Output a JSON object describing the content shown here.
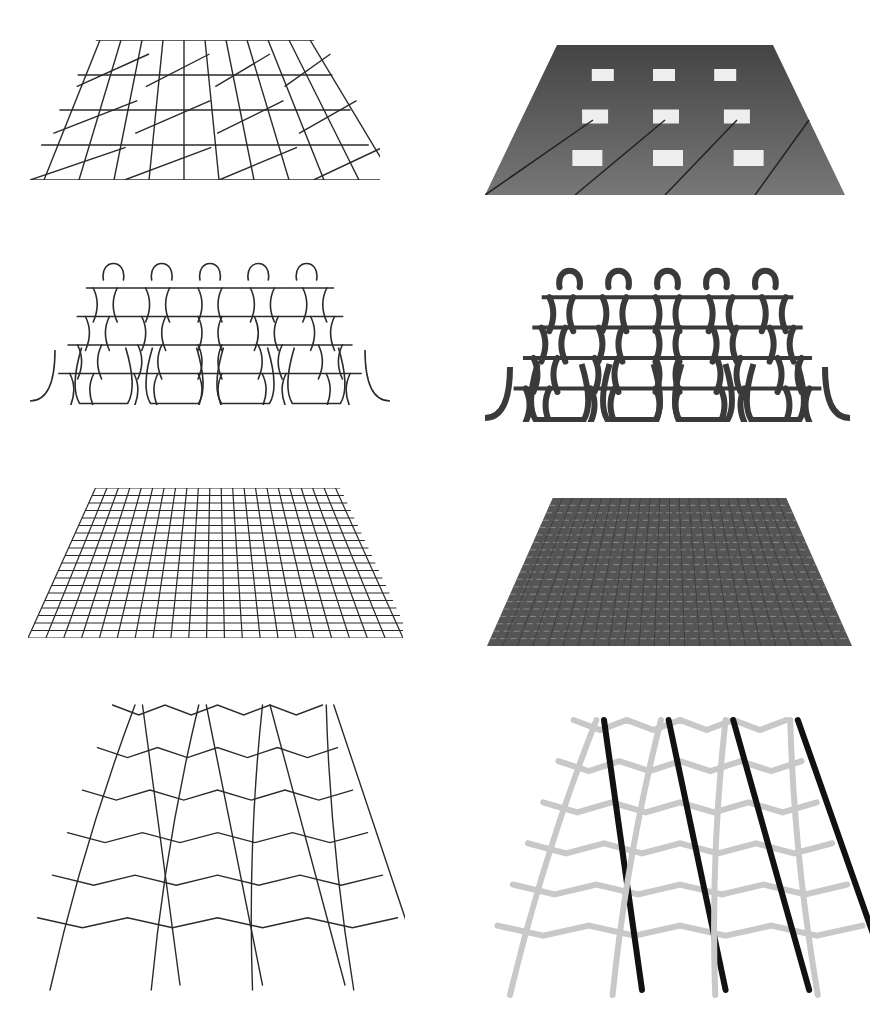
{
  "figure": {
    "layout": {
      "rows": 4,
      "cols": 2,
      "width": 890,
      "height": 1024
    },
    "colors": {
      "background": "#ffffff",
      "line": "#2a2a2a",
      "render_dark": "#4a4a4a",
      "render_mid": "#6e6e6e",
      "yarn_light": "#c8c8c8",
      "yarn_dark": "#111111"
    },
    "panels": [
      {
        "id": "woven-wire",
        "row": 0,
        "col": 0,
        "style": "wireframe",
        "pattern": "woven-diagonal",
        "box": [
          30,
          40,
          350,
          140
        ]
      },
      {
        "id": "woven-render",
        "row": 0,
        "col": 1,
        "style": "rendered",
        "pattern": "woven-diagonal",
        "box": [
          485,
          45,
          360,
          150
        ]
      },
      {
        "id": "knit-wire",
        "row": 1,
        "col": 0,
        "style": "wireframe",
        "pattern": "weft-knit",
        "box": [
          30,
          255,
          360,
          150
        ]
      },
      {
        "id": "knit-render",
        "row": 1,
        "col": 1,
        "style": "rendered",
        "pattern": "weft-knit",
        "box": [
          485,
          262,
          365,
          160
        ]
      },
      {
        "id": "plain-wire",
        "row": 2,
        "col": 0,
        "style": "wireframe",
        "pattern": "plain-weave",
        "box": [
          28,
          488,
          375,
          150
        ]
      },
      {
        "id": "plain-render",
        "row": 2,
        "col": 1,
        "style": "rendered",
        "pattern": "plain-weave",
        "box": [
          487,
          498,
          365,
          148
        ]
      },
      {
        "id": "leno-wire",
        "row": 3,
        "col": 0,
        "style": "wireframe",
        "pattern": "twisted-net",
        "box": [
          30,
          695,
          375,
          300
        ]
      },
      {
        "id": "leno-render",
        "row": 3,
        "col": 1,
        "style": "rendered",
        "pattern": "twisted-net",
        "box": [
          490,
          710,
          380,
          290
        ]
      }
    ]
  }
}
